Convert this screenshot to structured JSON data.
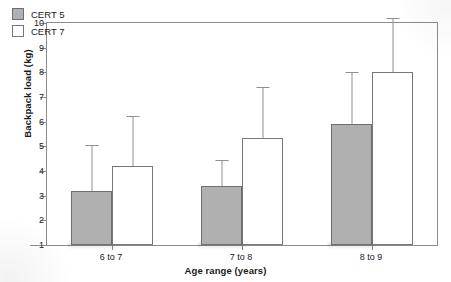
{
  "chart_data": {
    "type": "bar",
    "title": "",
    "xlabel": "Age range (years)",
    "ylabel": "Backpack load (kg)",
    "categories": [
      "6 to 7",
      "7 to 8",
      "8 to 9"
    ],
    "ylim": [
      1,
      10
    ],
    "yticks": [
      1,
      2,
      3,
      4,
      5,
      6,
      7,
      8,
      9,
      10
    ],
    "ytick_labels": [
      "1",
      "2",
      "3",
      "4",
      "5",
      "6",
      "7",
      "8",
      "9",
      "10"
    ],
    "grid": false,
    "legend_position": "top-left",
    "series": [
      {
        "name": "CERT 5",
        "color": "#b0b0b0",
        "values": [
          3.2,
          3.4,
          5.9
        ],
        "errors_upper": [
          5.05,
          4.45,
          8.0
        ]
      },
      {
        "name": "CERT 7",
        "color": "#ffffff",
        "values": [
          4.2,
          5.35,
          8.0
        ],
        "errors_upper": [
          6.25,
          7.4,
          10.2
        ]
      }
    ]
  },
  "legend": {
    "items": [
      {
        "label": "CERT 5",
        "swatch": "cert5"
      },
      {
        "label": "CERT 7",
        "swatch": "cert7"
      }
    ]
  },
  "axes": {
    "y_title": "Backpack load (kg)",
    "x_title": "Age range (years)"
  }
}
